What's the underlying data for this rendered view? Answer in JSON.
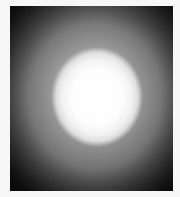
{
  "image": {
    "subject": "bright circular light glow on dark background",
    "alt": "Blurred white circular glow centered in a dark grayscale frame",
    "colors": {
      "background": "#f7f7f7",
      "frame_dark": "#0d0d0d",
      "mid_gray": "#8a8a8a",
      "glow_core": "#ffffff"
    }
  }
}
